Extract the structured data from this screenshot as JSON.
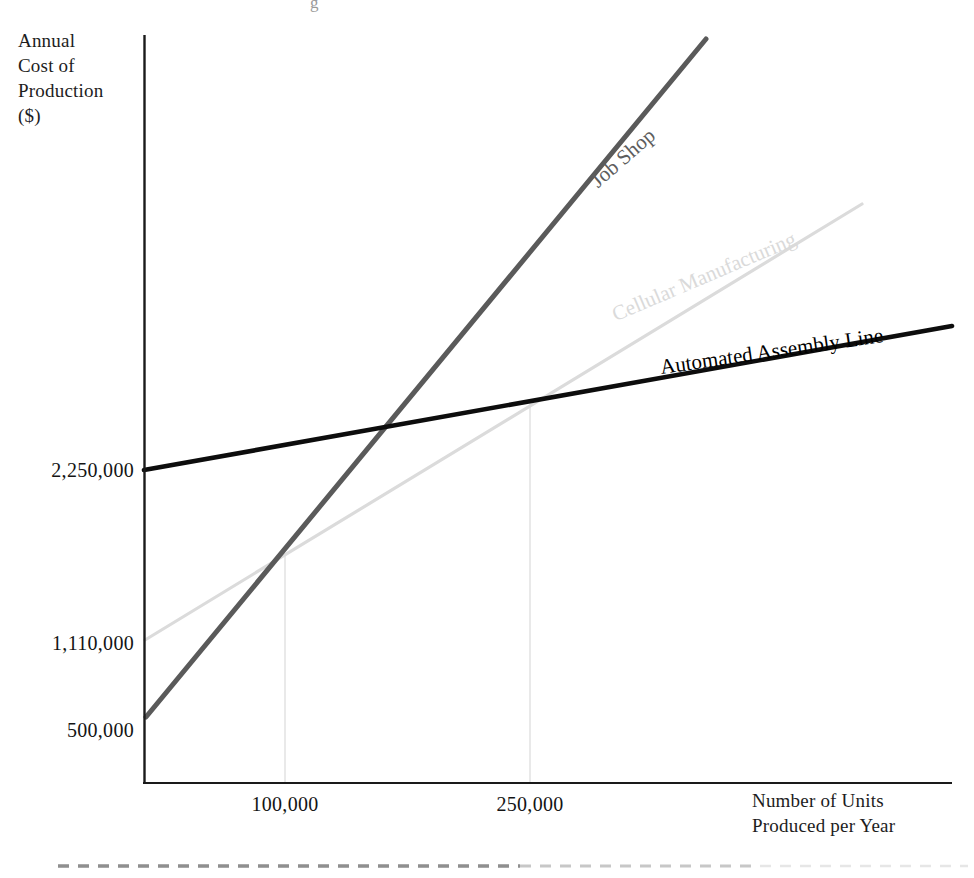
{
  "chart_data": {
    "type": "line",
    "title": "",
    "xlabel": "Number of Units Produced per Year",
    "ylabel": "Annual Cost of Production ($)",
    "grid": false,
    "legend_position": "inline-series-labels",
    "x_ticks": [
      "100,000",
      "250,000"
    ],
    "x_tick_values": [
      100000,
      250000
    ],
    "y_ticks": [
      "2,250,000",
      "1,110,000",
      "500,000"
    ],
    "y_tick_values": [
      2250000,
      1110000,
      500000
    ],
    "xlim": [
      0,
      360000
    ],
    "ylim": [
      0,
      5200000
    ],
    "series": [
      {
        "name": "Job Shop",
        "color": "#5a5a5a",
        "x": [
          12000,
          100000,
          250000,
          310000
        ],
        "values": [
          500000,
          1700000,
          3750000,
          4570000
        ],
        "y_intercept": 500000,
        "description": "Steepest slope; lowest fixed cost, highest variable cost per unit"
      },
      {
        "name": "Cellular Manufacturing",
        "color": "#dbdbdb",
        "x": [
          12000,
          100000,
          250000,
          340000
        ],
        "values": [
          1110000,
          1700000,
          2700000,
          3300000
        ],
        "y_intercept": 1110000,
        "description": "Intermediate slope; crosses Job Shop at 100,000 units and Automated Assembly Line at 250,000 units"
      },
      {
        "name": "Automated Assembly Line",
        "color": "#000000",
        "x": [
          0,
          100000,
          250000,
          360000
        ],
        "values": [
          2250000,
          2430000,
          2700000,
          2900000
        ],
        "y_intercept": 2250000,
        "description": "Flattest slope; highest fixed cost, lowest variable cost per unit"
      }
    ],
    "intersections": [
      {
        "label": "100,000",
        "x": 100000,
        "y": 1700000,
        "between": [
          "Job Shop",
          "Cellular Manufacturing"
        ],
        "dropline": true
      },
      {
        "label": "250,000",
        "x": 250000,
        "y": 2700000,
        "between": [
          "Cellular Manufacturing",
          "Automated Assembly Line"
        ],
        "dropline": true
      }
    ],
    "annotations": [
      "Job Shop",
      "Cellular Manufacturing",
      "Automated Assembly Line"
    ]
  },
  "axes": {
    "y_title_lines": "Annual\nCost of\nProduction\n($)",
    "x_title_lines": "Number of Units\nProduced per Year"
  },
  "colors": {
    "job_shop": "#5a5a5a",
    "cellular": "#dbdbdb",
    "automated": "#000000",
    "axis": "#1a1a1a",
    "dropline": "#e2e2e2",
    "footer_rule": "#8d8d8d",
    "background": "#ffffff"
  },
  "footer": {
    "rule_style": "dashed"
  }
}
